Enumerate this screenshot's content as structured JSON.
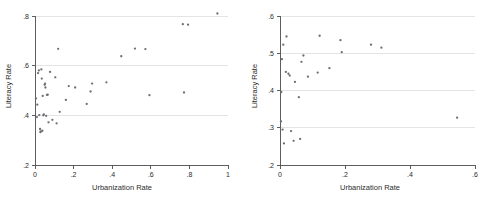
{
  "figure": {
    "background_color": "#ffffff",
    "point_color": "#6e6e75",
    "grid_color": "#d9d9d9",
    "axis_color": "#4d4d4d"
  },
  "chart_data": [
    {
      "type": "scatter",
      "panel": "left",
      "title": "",
      "xlabel": "Urbanization Rate",
      "ylabel": "Literacy Rate",
      "xlim": [
        0,
        1
      ],
      "ylim": [
        0.2,
        0.8
      ],
      "xticks": [
        0,
        0.2,
        0.4,
        0.6,
        0.8,
        1
      ],
      "xticklabels": [
        "0",
        ".2",
        ".4",
        ".6",
        ".8",
        "1"
      ],
      "yticks": [
        0.2,
        0.4,
        0.6,
        0.8
      ],
      "yticklabels": [
        ".2",
        ".4",
        ".6",
        ".8"
      ],
      "grid": "horizontal",
      "gridlines_y": [
        0.4,
        0.6,
        0.8
      ],
      "legend": "none",
      "points": [
        [
          0.005,
          0.468
        ],
        [
          0.01,
          0.393
        ],
        [
          0.012,
          0.443
        ],
        [
          0.016,
          0.57
        ],
        [
          0.02,
          0.581
        ],
        [
          0.022,
          0.401
        ],
        [
          0.026,
          0.345
        ],
        [
          0.028,
          0.332
        ],
        [
          0.03,
          0.335
        ],
        [
          0.033,
          0.585
        ],
        [
          0.035,
          0.548
        ],
        [
          0.038,
          0.338
        ],
        [
          0.04,
          0.478
        ],
        [
          0.043,
          0.4
        ],
        [
          0.046,
          0.404
        ],
        [
          0.05,
          0.523
        ],
        [
          0.052,
          0.528
        ],
        [
          0.054,
          0.512
        ],
        [
          0.058,
          0.398
        ],
        [
          0.062,
          0.482
        ],
        [
          0.066,
          0.483
        ],
        [
          0.07,
          0.372
        ],
        [
          0.078,
          0.575
        ],
        [
          0.09,
          0.382
        ],
        [
          0.105,
          0.553
        ],
        [
          0.112,
          0.368
        ],
        [
          0.12,
          0.668
        ],
        [
          0.128,
          0.414
        ],
        [
          0.16,
          0.462
        ],
        [
          0.175,
          0.518
        ],
        [
          0.208,
          0.512
        ],
        [
          0.268,
          0.446
        ],
        [
          0.288,
          0.496
        ],
        [
          0.296,
          0.528
        ],
        [
          0.37,
          0.533
        ],
        [
          0.447,
          0.638
        ],
        [
          0.518,
          0.669
        ],
        [
          0.572,
          0.667
        ],
        [
          0.593,
          0.481
        ],
        [
          0.766,
          0.767
        ],
        [
          0.772,
          0.492
        ],
        [
          0.793,
          0.765
        ],
        [
          0.945,
          0.81
        ]
      ]
    },
    {
      "type": "scatter",
      "panel": "right",
      "title": "",
      "xlabel": "Urbanization Rate",
      "ylabel": "Literacy Rate",
      "xlim": [
        0,
        0.6
      ],
      "ylim": [
        0.2,
        0.6
      ],
      "xticks": [
        0,
        0.2,
        0.4,
        0.6
      ],
      "xticklabels": [
        "0",
        ".2",
        ".4",
        ".6"
      ],
      "yticks": [
        0.2,
        0.3,
        0.4,
        0.5,
        0.6
      ],
      "yticklabels": [
        ".2",
        ".3",
        ".4",
        ".5",
        ".6"
      ],
      "grid": "horizontal",
      "gridlines_y": [
        0.3,
        0.4,
        0.5,
        0.6
      ],
      "legend": "none",
      "points": [
        [
          0.003,
          0.317
        ],
        [
          0.004,
          0.396
        ],
        [
          0.006,
          0.484
        ],
        [
          0.008,
          0.295
        ],
        [
          0.01,
          0.523
        ],
        [
          0.012,
          0.258
        ],
        [
          0.018,
          0.45
        ],
        [
          0.02,
          0.545
        ],
        [
          0.026,
          0.445
        ],
        [
          0.03,
          0.44
        ],
        [
          0.034,
          0.291
        ],
        [
          0.042,
          0.265
        ],
        [
          0.046,
          0.423
        ],
        [
          0.058,
          0.382
        ],
        [
          0.062,
          0.27
        ],
        [
          0.066,
          0.477
        ],
        [
          0.072,
          0.494
        ],
        [
          0.086,
          0.437
        ],
        [
          0.116,
          0.448
        ],
        [
          0.122,
          0.547
        ],
        [
          0.152,
          0.46
        ],
        [
          0.186,
          0.535
        ],
        [
          0.19,
          0.503
        ],
        [
          0.28,
          0.523
        ],
        [
          0.312,
          0.515
        ],
        [
          0.545,
          0.327
        ]
      ]
    }
  ]
}
